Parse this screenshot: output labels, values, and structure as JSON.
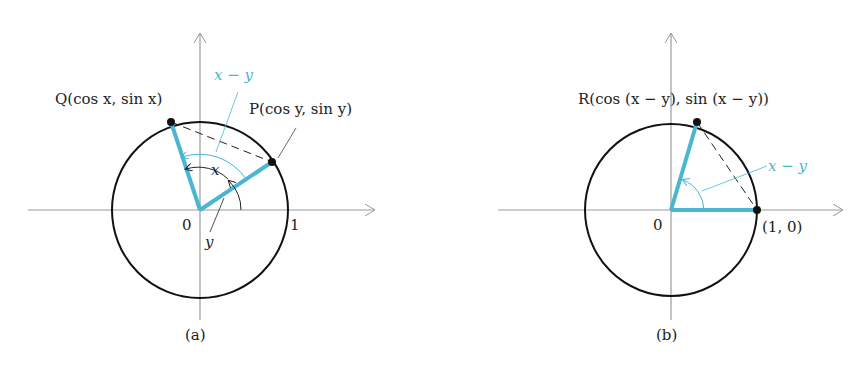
{
  "figure_a": {
    "caption": "(a)",
    "origin_label": "0",
    "one_label": "1",
    "Q_label": "Q(cos x, sin x)",
    "P_label": "P(cos y, sin y)",
    "angle_x_label": "x",
    "angle_y_label": "y",
    "angle_diff_label": "x − y"
  },
  "figure_b": {
    "caption": "(b)",
    "origin_label": "0",
    "R_label": "R(cos (x − y), sin (x − y))",
    "point_label": "(1, 0)",
    "angle_diff_label": "x − y"
  },
  "colors": {
    "accent": "#4ab6cf",
    "axis": "#9a9a9a",
    "ink": "#111111"
  }
}
